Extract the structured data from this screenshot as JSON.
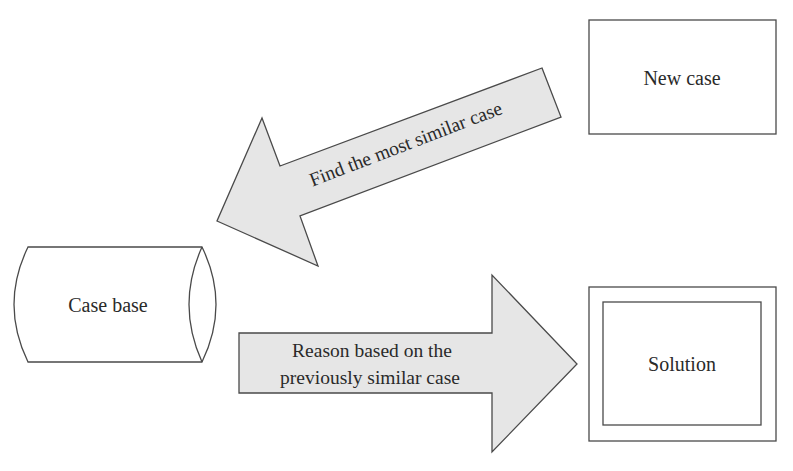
{
  "diagram": {
    "type": "case-based-reasoning-flow",
    "nodes": {
      "new_case": {
        "label": "New case",
        "shape": "rectangle"
      },
      "case_base": {
        "label": "Case base",
        "shape": "cylinder"
      },
      "solution": {
        "label": "Solution",
        "shape": "double-rectangle"
      }
    },
    "edges": {
      "find_similar": {
        "from": "new_case",
        "to": "case_base",
        "label": "Find the most similar case"
      },
      "reason": {
        "from": "case_base",
        "to": "solution",
        "label_line1": "Reason based on the",
        "label_line2": "previously similar case"
      }
    },
    "colors": {
      "background": "#ffffff",
      "arrow_fill": "#e6e6e6",
      "stroke": "#4a4a4a",
      "text": "#2a2a2a"
    }
  }
}
